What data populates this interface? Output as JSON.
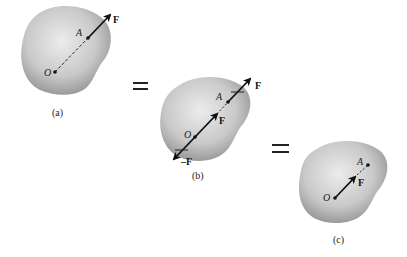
{
  "figure": {
    "panels": [
      {
        "id": "a",
        "caption": "(a)",
        "point_o": "O",
        "point_a": "A",
        "force_label": "F"
      },
      {
        "id": "b",
        "caption": "(b)",
        "point_o": "O",
        "point_a": "A",
        "force_label_top": "F",
        "force_label_mid": "F",
        "force_label_neg": "–F"
      },
      {
        "id": "c",
        "caption": "(c)",
        "point_o": "O",
        "point_a": "A",
        "force_label": "F"
      }
    ],
    "equals_symbol": "="
  },
  "colors": {
    "body_fill_center": "#e8e8e8",
    "body_fill_edge": "#9a9a9a",
    "arrow": "#111111"
  }
}
